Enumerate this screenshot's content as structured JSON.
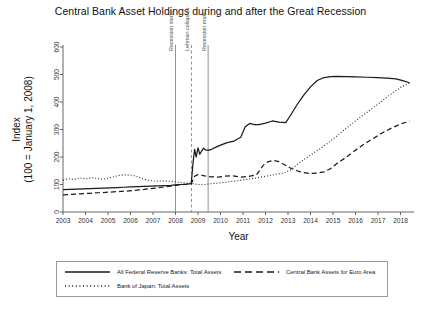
{
  "chart_data": {
    "type": "line",
    "title": "Central Bank Asset Holdings during and after the Great Recession",
    "xlabel": "Year",
    "ylabel_line1": "Index",
    "ylabel_line2": "(100 = January 1, 2008)",
    "xlim": [
      2003,
      2018.6
    ],
    "ylim": [
      0,
      600
    ],
    "yticks": [
      0,
      100,
      200,
      300,
      400,
      500,
      600
    ],
    "xticks": [
      2003,
      2004,
      2005,
      2006,
      2007,
      2008,
      2009,
      2010,
      2011,
      2012,
      2013,
      2014,
      2015,
      2016,
      2017,
      2018
    ],
    "grid": false,
    "legend_position": "below-plot",
    "annotations": [
      {
        "label": "Recession starts",
        "x": 2008.0,
        "style": "solid"
      },
      {
        "label": "Lehman collapses",
        "x": 2008.71,
        "style": "dashed"
      },
      {
        "label": "Recession ends",
        "x": 2009.45,
        "style": "solid"
      }
    ],
    "series": [
      {
        "name": "All Federal Reserve Banks: Total Assets",
        "style": "solid",
        "x": [
          2003.0,
          2003.3,
          2003.6,
          2003.9,
          2004.2,
          2004.5,
          2004.8,
          2005.1,
          2005.4,
          2005.7,
          2006.0,
          2006.3,
          2006.6,
          2006.9,
          2007.2,
          2007.5,
          2007.8,
          2008.0,
          2008.25,
          2008.5,
          2008.7,
          2008.78,
          2008.85,
          2008.92,
          2009.0,
          2009.08,
          2009.16,
          2009.25,
          2009.33,
          2009.45,
          2009.6,
          2009.8,
          2010.0,
          2010.3,
          2010.6,
          2010.9,
          2011.1,
          2011.3,
          2011.5,
          2011.7,
          2012.0,
          2012.3,
          2012.6,
          2012.9,
          2013.1,
          2013.4,
          2013.7,
          2014.0,
          2014.3,
          2014.6,
          2014.9,
          2015.2,
          2015.6,
          2016.0,
          2016.5,
          2017.0,
          2017.4,
          2017.8,
          2018.1,
          2018.4
        ],
        "y": [
          81,
          82,
          83,
          84,
          85,
          86,
          87,
          88,
          89,
          90,
          91,
          92,
          93,
          94,
          95,
          96,
          97,
          99,
          100,
          101,
          103,
          180,
          228,
          200,
          233,
          210,
          221,
          232,
          226,
          224,
          228,
          236,
          243,
          252,
          258,
          272,
          310,
          322,
          318,
          318,
          323,
          331,
          327,
          325,
          350,
          390,
          425,
          455,
          478,
          489,
          492,
          493,
          492,
          491,
          490,
          489,
          487,
          484,
          478,
          470
        ]
      },
      {
        "name": "Central Bank Assets for Euro Area",
        "style": "dashed",
        "x": [
          2003.0,
          2003.4,
          2003.8,
          2004.2,
          2004.6,
          2005.0,
          2005.4,
          2005.8,
          2006.2,
          2006.6,
          2007.0,
          2007.4,
          2007.8,
          2008.0,
          2008.4,
          2008.7,
          2008.85,
          2009.0,
          2009.3,
          2009.6,
          2009.9,
          2010.2,
          2010.5,
          2010.9,
          2011.2,
          2011.6,
          2011.9,
          2012.1,
          2012.35,
          2012.6,
          2012.85,
          2013.1,
          2013.4,
          2013.7,
          2014.0,
          2014.3,
          2014.6,
          2014.9,
          2015.2,
          2015.6,
          2016.0,
          2016.4,
          2016.8,
          2017.2,
          2017.6,
          2018.0,
          2018.4
        ],
        "y": [
          62,
          64,
          66,
          68,
          70,
          72,
          74,
          76,
          79,
          82,
          86,
          90,
          94,
          97,
          100,
          103,
          130,
          136,
          131,
          128,
          127,
          130,
          132,
          127,
          129,
          135,
          170,
          182,
          188,
          183,
          172,
          160,
          150,
          143,
          140,
          141,
          146,
          158,
          178,
          200,
          225,
          248,
          268,
          288,
          305,
          320,
          330
        ]
      },
      {
        "name": "Bank of Japan: Total Assets",
        "style": "dotted",
        "x": [
          2003.0,
          2003.25,
          2003.5,
          2003.75,
          2004.0,
          2004.25,
          2004.5,
          2004.75,
          2005.0,
          2005.25,
          2005.5,
          2005.75,
          2006.0,
          2006.25,
          2006.5,
          2006.75,
          2007.0,
          2007.2,
          2007.45,
          2007.7,
          2007.9,
          2008.1,
          2008.4,
          2008.7,
          2009.0,
          2009.3,
          2009.6,
          2010.0,
          2010.4,
          2010.8,
          2011.2,
          2011.6,
          2012.0,
          2012.4,
          2012.8,
          2013.1,
          2013.4,
          2013.8,
          2014.2,
          2014.6,
          2015.0,
          2015.4,
          2015.8,
          2016.2,
          2016.6,
          2017.0,
          2017.4,
          2017.8,
          2018.1,
          2018.4
        ],
        "y": [
          116,
          121,
          118,
          124,
          120,
          125,
          122,
          119,
          123,
          128,
          133,
          135,
          134,
          131,
          122,
          116,
          113,
          112,
          113,
          112,
          111,
          108,
          106,
          104,
          100,
          100,
          103,
          106,
          110,
          114,
          119,
          124,
          130,
          136,
          142,
          152,
          172,
          196,
          218,
          240,
          265,
          292,
          318,
          344,
          368,
          392,
          418,
          442,
          458,
          468
        ]
      }
    ]
  },
  "legend": {
    "entries": [
      {
        "label": "All Federal Reserve Banks: Total Assets",
        "style": "solid"
      },
      {
        "label": "Central Bank Assets for Euro Area",
        "style": "dashed"
      },
      {
        "label": "Bank of Japan: Total Assets",
        "style": "dotted"
      }
    ]
  },
  "colors": {
    "line": "#1a1a1a",
    "axis": "#555555",
    "annotation_line": "#777777",
    "background": "#ffffff"
  }
}
